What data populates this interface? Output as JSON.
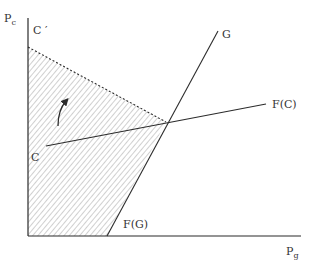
{
  "diagram": {
    "axes": {
      "y_label": "P",
      "y_label_sub": "c",
      "x_label": "P",
      "x_label_sub": "g"
    },
    "labels": {
      "c_prime": "C ′",
      "c": "C",
      "g": "G",
      "fc": "F(C)",
      "fg": "F(G)"
    },
    "colors": {
      "line": "#2b2b2b",
      "hatch": "#8a8a8a"
    },
    "region": "hatched feasible set bounded by C′ dashed line, G line and axes",
    "arrow": "curved arrow pointing upward from C toward C′"
  }
}
